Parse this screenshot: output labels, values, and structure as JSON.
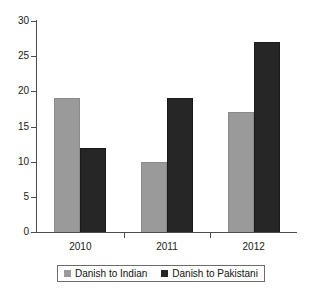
{
  "chart_data": {
    "type": "bar",
    "title": "",
    "subtitle": "",
    "xlabel": "",
    "ylabel": "",
    "categories": [
      "2010",
      "2011",
      "2012"
    ],
    "series": [
      {
        "name": "Danish to Indian",
        "values": [
          19,
          10,
          17
        ],
        "color": "#9a9a9a"
      },
      {
        "name": "Danish to Pakistani",
        "values": [
          12,
          19,
          27
        ],
        "color": "#262626"
      }
    ],
    "ylim": [
      0,
      30
    ],
    "yticks": [
      0,
      5,
      10,
      15,
      20,
      25,
      30
    ],
    "ytick_labels": [
      "0",
      "5",
      "10",
      "15",
      "20",
      "25",
      "30"
    ],
    "xtick_labels": [
      "2010",
      "2011",
      "2012"
    ],
    "grid": false,
    "legend_position": "bottom",
    "orientation": "vertical",
    "grouping": "grouped",
    "annotations": []
  },
  "legend": {
    "entries": [
      {
        "label": "Danish to Indian",
        "color": "#9a9a9a"
      },
      {
        "label": "Danish to Pakistani",
        "color": "#262626"
      }
    ]
  }
}
